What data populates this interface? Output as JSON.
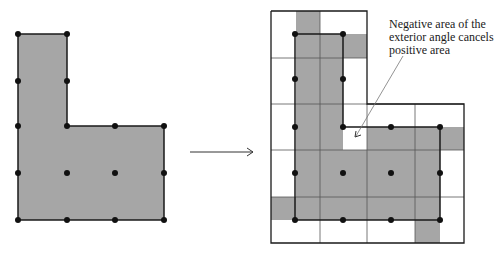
{
  "annotation": {
    "text": "Negative area of the exterior angle cancels positive area"
  },
  "colors": {
    "fill": "#a6a6a6",
    "stroke": "#1a1a1a",
    "grid": "#555555"
  },
  "left_figure": {
    "polygon": [
      [
        18,
        34
      ],
      [
        67,
        34
      ],
      [
        67,
        126
      ],
      [
        164,
        126
      ],
      [
        164,
        220
      ],
      [
        18,
        220
      ]
    ],
    "dots": [
      [
        18,
        34
      ],
      [
        67,
        34
      ],
      [
        18,
        81
      ],
      [
        67,
        81
      ],
      [
        18,
        126
      ],
      [
        67,
        126
      ],
      [
        115,
        126
      ],
      [
        164,
        126
      ],
      [
        18,
        173
      ],
      [
        67,
        173
      ],
      [
        115,
        173
      ],
      [
        164,
        173
      ],
      [
        18,
        220
      ],
      [
        67,
        220
      ],
      [
        115,
        220
      ],
      [
        164,
        220
      ]
    ]
  },
  "arrow": {
    "x1": 190,
    "y1": 152,
    "x2": 253,
    "y2": 152
  },
  "right_figure": {
    "polygon": [
      [
        295,
        34
      ],
      [
        343,
        34
      ],
      [
        343,
        127
      ],
      [
        440,
        127
      ],
      [
        440,
        220
      ],
      [
        295,
        220
      ]
    ],
    "dots": [
      [
        295,
        34
      ],
      [
        343,
        34
      ],
      [
        295,
        79
      ],
      [
        343,
        79
      ],
      [
        295,
        127
      ],
      [
        343,
        127
      ],
      [
        391,
        127
      ],
      [
        440,
        127
      ],
      [
        295,
        173
      ],
      [
        343,
        173
      ],
      [
        391,
        173
      ],
      [
        440,
        173
      ],
      [
        295,
        220
      ],
      [
        343,
        220
      ],
      [
        391,
        220
      ],
      [
        440,
        220
      ]
    ]
  }
}
